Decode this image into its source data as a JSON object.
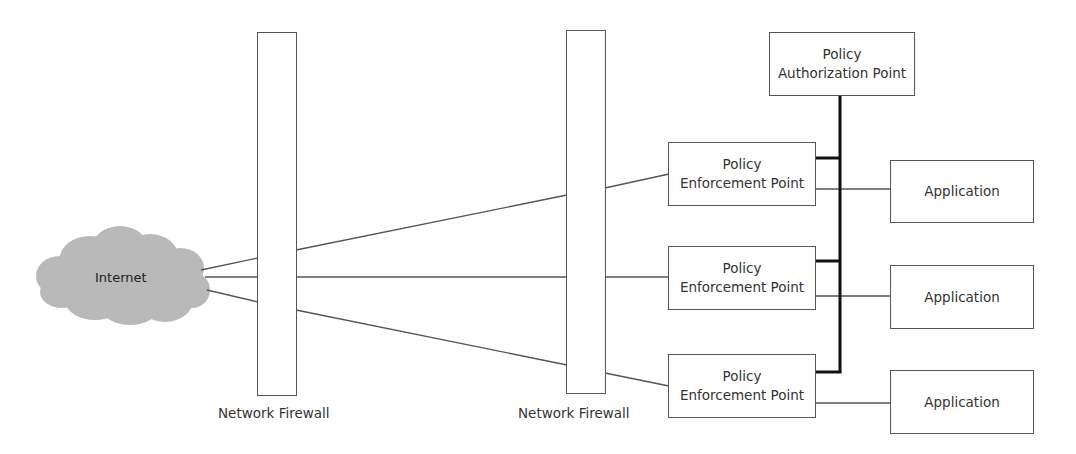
{
  "diagram": {
    "internet": {
      "label": "Internet",
      "fill": "#b8b8b8"
    },
    "firewalls": [
      {
        "label": "Network Firewall"
      },
      {
        "label": "Network Firewall"
      }
    ],
    "authorization_point": {
      "line1": "Policy",
      "line2": "Authorization Point"
    },
    "enforcement_points": [
      {
        "line1": "Policy",
        "line2": "Enforcement Point"
      },
      {
        "line1": "Policy",
        "line2": "Enforcement Point"
      },
      {
        "line1": "Policy",
        "line2": "Enforcement Point"
      }
    ],
    "applications": [
      {
        "label": "Application"
      },
      {
        "label": "Application"
      },
      {
        "label": "Application"
      }
    ],
    "colors": {
      "line": "#555555",
      "bus": "#111111",
      "cloud": "#b8b8b8"
    }
  }
}
